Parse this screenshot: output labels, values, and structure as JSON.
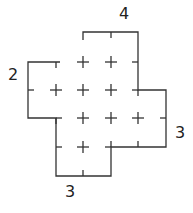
{
  "labels": {
    "top": "4",
    "left": "2",
    "right": "3",
    "bottom": "3"
  },
  "colors": {
    "stroke": "#333333",
    "text": "#222222"
  },
  "grid": {
    "columns_x": [
      28,
      56,
      83,
      111,
      138,
      166
    ],
    "rows_y": [
      32,
      62,
      90,
      118,
      147,
      176
    ]
  }
}
